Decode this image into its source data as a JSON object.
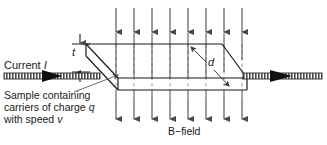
{
  "figure": {
    "background_color": "#ffffff",
    "line_color": "#1a1a1a",
    "arrow_color": "#3a3a3a",
    "dash_color": "#9a9a9a",
    "wire_color": "#4a4a4a"
  },
  "labels": {
    "current_text": "Current ",
    "current_symbol": "I",
    "thickness_symbol": "t",
    "depth_symbol": "d",
    "b_field": "B−field",
    "sample_line1": "Sample containing",
    "sample_line2_a": "carriers of charge ",
    "sample_line2_b": "q",
    "sample_line3_a": "with speed ",
    "sample_line3_b": "v",
    "corner_artifact": "··"
  },
  "geometry": {
    "slab": {
      "front_top_left_x": 118,
      "front_top_left_y": 78,
      "front_top_right_x": 247,
      "front_top_right_y": 78,
      "front_bottom_left_x": 118,
      "front_bottom_left_y": 90,
      "front_bottom_right_x": 247,
      "front_bottom_right_y": 90,
      "back_top_left_x": 86,
      "back_top_left_y": 44,
      "back_top_right_x": 222,
      "back_top_right_y": 44,
      "left_face_bottom_x": 86,
      "left_face_bottom_y": 56
    },
    "b_arrows": {
      "count": 8,
      "x_positions": [
        116,
        134,
        152,
        170,
        188,
        206,
        224,
        242
      ],
      "top_start_y": 8,
      "top_end_y": 33,
      "bottom_start_y": 95,
      "bottom_end_y": 120,
      "dashed_top_y": 44,
      "dashed_bottom_y": 90
    },
    "wire": {
      "left_x1": 4,
      "left_x2": 100,
      "left_y": 76,
      "right_x1": 243,
      "right_x2": 322,
      "right_y": 76,
      "band_height": 6
    },
    "leader": {
      "from_x": 74,
      "from_y": 92,
      "to_x": 120,
      "to_y": 74
    },
    "t_dimension": {
      "x": 80,
      "top_y": 44,
      "bottom_y": 72
    },
    "d_dimension": {
      "x1": 192,
      "y1": 48,
      "x2": 228,
      "y2": 86
    }
  }
}
